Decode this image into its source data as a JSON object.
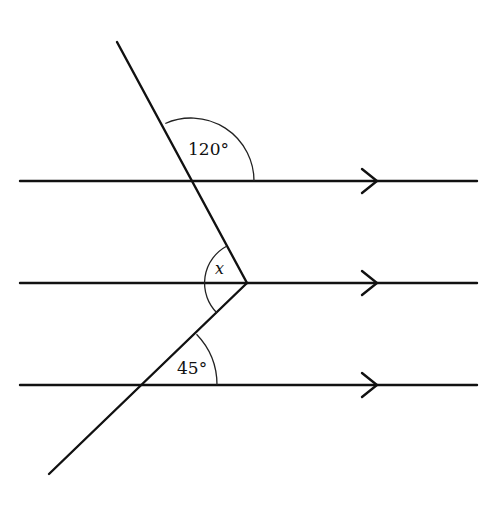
{
  "diagram": {
    "type": "parallel-lines-angles",
    "parallel_lines": [
      {
        "id": "line-top",
        "y": 181,
        "x1": 20,
        "x2": 477,
        "arrow_x": 376
      },
      {
        "id": "line-middle",
        "y": 283,
        "x1": 20,
        "x2": 477,
        "arrow_x": 376
      },
      {
        "id": "line-bottom",
        "y": 385,
        "x1": 20,
        "x2": 477,
        "arrow_x": 376
      }
    ],
    "transversals": [
      {
        "id": "upper-segment",
        "x1": 117,
        "y1": 42,
        "x2": 247,
        "y2": 283
      },
      {
        "id": "lower-segment",
        "x1": 247,
        "y1": 283,
        "x2": 49,
        "y2": 474
      }
    ],
    "angles": [
      {
        "id": "angle-120",
        "label": "120°",
        "value": 120
      },
      {
        "id": "angle-x",
        "label": "x",
        "value": null
      },
      {
        "id": "angle-45",
        "label": "45°",
        "value": 45
      }
    ]
  },
  "labels": {
    "angle_top": "120°",
    "angle_middle": "x",
    "angle_bottom": "45°"
  }
}
